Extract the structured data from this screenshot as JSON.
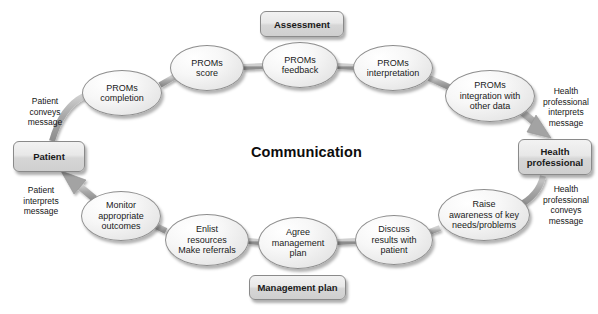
{
  "diagram": {
    "title": "Communication",
    "center_label": "Communication",
    "stage_width": 598,
    "stage_height": 314,
    "colors": {
      "background": "#ffffff",
      "node_fill": "#e8e8e8",
      "node_border": "#8e8e8e",
      "connector": "#9a9a9a",
      "text": "#1a1a1a"
    },
    "boxes": [
      {
        "id": "assessment",
        "label": "Assessment",
        "x": 260,
        "y": 11,
        "w": 84,
        "h": 26
      },
      {
        "id": "patient",
        "label": "Patient",
        "x": 13,
        "y": 141,
        "w": 72,
        "h": 31
      },
      {
        "id": "health-professional",
        "label": "Health\nprofessional",
        "label_line1": "Health",
        "label_line2": "professional",
        "x": 518,
        "y": 139,
        "w": 74,
        "h": 36
      },
      {
        "id": "management-plan",
        "label": "Management plan",
        "x": 249,
        "y": 275,
        "w": 97,
        "h": 25
      }
    ],
    "ellipses": [
      {
        "id": "proms-completion",
        "label": "PROMs\ncompletion",
        "lines": [
          "PROMs",
          "completion"
        ],
        "cx": 122,
        "cy": 93,
        "rx": 40,
        "ry": 23
      },
      {
        "id": "proms-score",
        "label": "PROMs\nscore",
        "lines": [
          "PROMs",
          "score"
        ],
        "cx": 207,
        "cy": 68,
        "rx": 37,
        "ry": 23
      },
      {
        "id": "proms-feedback",
        "label": "PROMs\nfeedback",
        "lines": [
          "PROMs",
          "feedback"
        ],
        "cx": 300,
        "cy": 65,
        "rx": 38,
        "ry": 23
      },
      {
        "id": "proms-interpretation",
        "label": "PROMs\ninterpretation",
        "lines": [
          "PROMs",
          "interpretation"
        ],
        "cx": 393,
        "cy": 68,
        "rx": 40,
        "ry": 23
      },
      {
        "id": "proms-integration",
        "label": "PROMs\nintegration with\nother data",
        "lines": [
          "PROMs",
          "integration with",
          "other data"
        ],
        "cx": 490,
        "cy": 96,
        "rx": 45,
        "ry": 26
      },
      {
        "id": "raise-awareness",
        "label": "Raise\nawareness of key\nneeds/problems",
        "lines": [
          "Raise",
          "awareness of key",
          "needs/problems"
        ],
        "cx": 484,
        "cy": 215,
        "rx": 46,
        "ry": 26
      },
      {
        "id": "discuss-results",
        "label": "Discuss\nresults with\npatient",
        "lines": [
          "Discuss",
          "results with",
          "patient"
        ],
        "cx": 394,
        "cy": 240,
        "rx": 39,
        "ry": 25
      },
      {
        "id": "agree-management-plan",
        "label": "Agree\nmanagement\nplan",
        "lines": [
          "Agree",
          "management",
          "plan"
        ],
        "cx": 298,
        "cy": 243,
        "rx": 40,
        "ry": 26
      },
      {
        "id": "enlist-resources",
        "label": "Enlist\nresources\nMake referrals",
        "lines": [
          "Enlist",
          "resources",
          "Make referrals"
        ],
        "cx": 207,
        "cy": 240,
        "rx": 42,
        "ry": 26
      },
      {
        "id": "monitor-outcomes",
        "label": "Monitor\nappropriate\noutcomes",
        "lines": [
          "Monitor",
          "appropriate",
          "outcomes"
        ],
        "cx": 121,
        "cy": 216,
        "rx": 40,
        "ry": 25
      }
    ],
    "captions": [
      {
        "id": "patient-conveys-message",
        "lines": [
          "Patient",
          "conveys",
          "message"
        ],
        "x": 14,
        "y": 96,
        "w": 62
      },
      {
        "id": "patient-interprets-message",
        "lines": [
          "Patient",
          "interprets",
          "message"
        ],
        "x": 10,
        "y": 185,
        "w": 62
      },
      {
        "id": "hp-interprets-message",
        "lines": [
          "Health",
          "professional",
          "interprets",
          "message"
        ],
        "x": 536,
        "y": 86,
        "w": 60
      },
      {
        "id": "hp-conveys-message",
        "lines": [
          "Health",
          "professional",
          "conveys",
          "message"
        ],
        "x": 536,
        "y": 184,
        "w": 60
      }
    ],
    "connectors": [
      {
        "from": "patient",
        "to": "proms-completion",
        "type": "link"
      },
      {
        "from": "proms-completion",
        "to": "proms-score",
        "type": "link"
      },
      {
        "from": "proms-score",
        "to": "proms-feedback",
        "type": "link"
      },
      {
        "from": "proms-feedback",
        "to": "proms-interpretation",
        "type": "link"
      },
      {
        "from": "proms-interpretation",
        "to": "proms-integration",
        "type": "link"
      },
      {
        "from": "proms-integration",
        "to": "health-professional",
        "type": "arrow"
      },
      {
        "from": "health-professional",
        "to": "raise-awareness",
        "type": "link"
      },
      {
        "from": "raise-awareness",
        "to": "discuss-results",
        "type": "link"
      },
      {
        "from": "discuss-results",
        "to": "agree-management-plan",
        "type": "link"
      },
      {
        "from": "agree-management-plan",
        "to": "enlist-resources",
        "type": "link"
      },
      {
        "from": "enlist-resources",
        "to": "monitor-outcomes",
        "type": "link"
      },
      {
        "from": "monitor-outcomes",
        "to": "patient",
        "type": "arrow"
      }
    ]
  }
}
